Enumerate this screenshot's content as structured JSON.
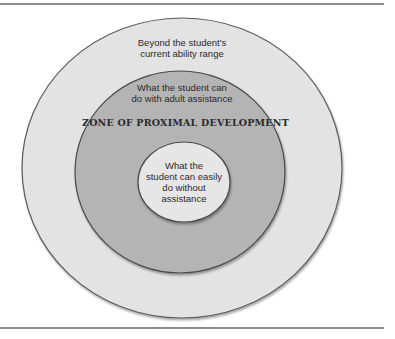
{
  "diagram": {
    "title": "Zone of Proximal Development",
    "colors": {
      "outer_fill": "#e3e3e3",
      "middle_fill": "#b4b4b4",
      "inner_fill": "#e6e6e6",
      "stroke": "#555555",
      "rule": "#8a8a8a"
    },
    "outer_circle": {
      "label_line1": "Beyond the student's",
      "label_line2": "current ability range"
    },
    "middle_circle": {
      "label_line1": "What the student can",
      "label_line2": "do with adult assistance",
      "zone_title": "ZONE OF PROXIMAL DEVELOPMENT"
    },
    "inner_circle": {
      "label_line1": "What the",
      "label_line2": "student can easily",
      "label_line3": "do without",
      "label_line4": "assistance"
    }
  }
}
